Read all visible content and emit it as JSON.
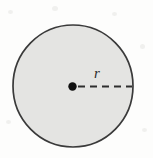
{
  "figure": {
    "kind": "geometry-diagram",
    "background_color": "#fdfdfc",
    "circle": {
      "name": "circle",
      "center_x": 73,
      "center_y": 86,
      "radius_x": 60,
      "radius_y": 61,
      "fill_color": "#e4e4e2",
      "stroke_color": "#3a3a3a",
      "stroke_width": 1.7
    },
    "center_dot": {
      "name": "center-point",
      "x": 72.5,
      "y": 86.5,
      "radius": 4.2,
      "color": "#111111"
    },
    "radius_line": {
      "name": "radius-dashed-line",
      "x1": 78,
      "y1": 86.5,
      "x2": 132,
      "y2": 86.5,
      "color": "#2e2e2e",
      "stroke_width": 2,
      "dash_length": 7,
      "gap_length": 5
    },
    "radius_label": {
      "text": "r",
      "style": "italic",
      "color": "#2b2b2b",
      "font_size_px": 15,
      "x": 94,
      "y": 66
    }
  }
}
